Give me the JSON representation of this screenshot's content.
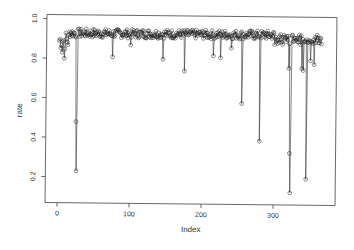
{
  "chart_data": {
    "type": "scatter",
    "title": "",
    "xlabel": "Index",
    "ylabel": "rate",
    "xlim": [
      0,
      370
    ],
    "ylim": [
      0.12,
      1.0
    ],
    "x_ticks": [
      0,
      100,
      200,
      300
    ],
    "y_ticks": [
      0.2,
      0.4,
      0.6,
      0.8,
      1.0
    ],
    "x_tick_labels": [
      "0",
      "100",
      "200",
      "300"
    ],
    "y_tick_labels": [
      "0.2",
      "0.4",
      "0.6",
      "0.8",
      "1.0"
    ],
    "grid": false,
    "legend": null,
    "style": "points joined by thin lines (type='b'), open circles",
    "baseline_band": [
      0.88,
      0.95
    ],
    "n_points": 365,
    "notable_dips": [
      {
        "x": 5,
        "y": 0.83
      },
      {
        "x": 8,
        "y": 0.8
      },
      {
        "x": 25,
        "y": 0.48
      },
      {
        "x": 26,
        "y": 0.23
      },
      {
        "x": 75,
        "y": 0.81
      },
      {
        "x": 100,
        "y": 0.87
      },
      {
        "x": 145,
        "y": 0.8
      },
      {
        "x": 175,
        "y": 0.74
      },
      {
        "x": 215,
        "y": 0.82
      },
      {
        "x": 225,
        "y": 0.81
      },
      {
        "x": 240,
        "y": 0.86
      },
      {
        "x": 255,
        "y": 0.58
      },
      {
        "x": 280,
        "y": 0.39
      },
      {
        "x": 300,
        "y": 0.88
      },
      {
        "x": 320,
        "y": 0.76
      },
      {
        "x": 322,
        "y": 0.33
      },
      {
        "x": 323,
        "y": 0.13
      },
      {
        "x": 338,
        "y": 0.76
      },
      {
        "x": 340,
        "y": 0.75
      },
      {
        "x": 345,
        "y": 0.2
      },
      {
        "x": 350,
        "y": 0.8
      },
      {
        "x": 355,
        "y": 0.78
      }
    ]
  },
  "axes": {
    "xlabel": "Index",
    "ylabel": "rate",
    "x_tick_labels": [
      "0",
      "100",
      "200",
      "300"
    ],
    "y_tick_labels": [
      "0.2",
      "0.4",
      "0.6",
      "0.8",
      "1.0"
    ]
  }
}
